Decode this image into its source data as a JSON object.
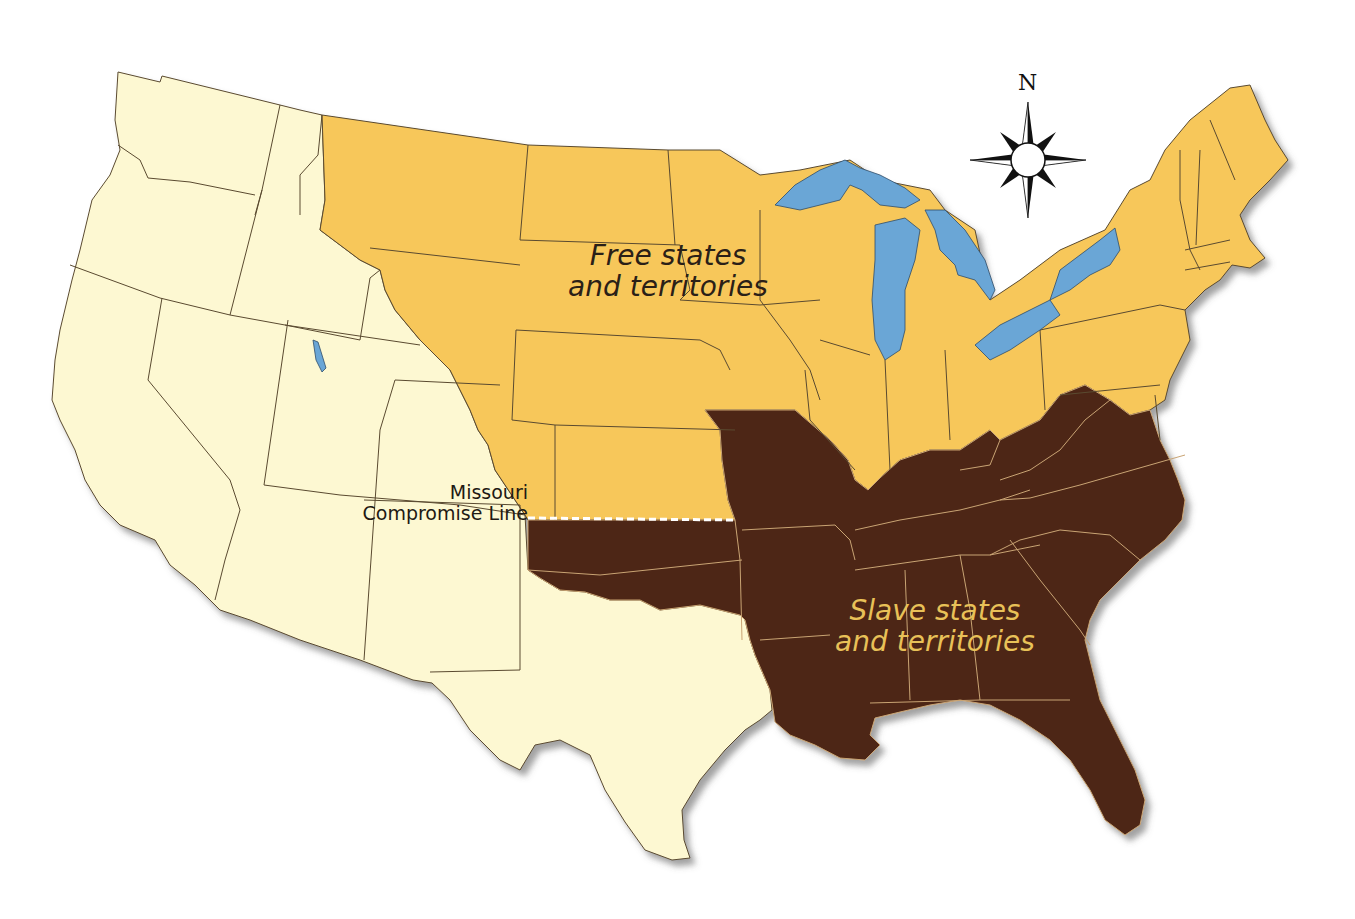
{
  "map": {
    "title": "",
    "regions": [
      {
        "id": "free",
        "label_line1": "Free states",
        "label_line2": "and territories",
        "color": "#f7c75a"
      },
      {
        "id": "slave",
        "label_line1": "Slave states",
        "label_line2": "and territories",
        "color": "#4d2512",
        "label_color": "#e8c158"
      },
      {
        "id": "unorganized-west",
        "label_line1": "",
        "label_line2": "",
        "color": "#fdf8d2"
      }
    ],
    "water_color": "#6aa6d6",
    "missouri_compromise_line": {
      "label_line1": "Missouri",
      "label_line2": "Compromise Line",
      "style": "dashed-white"
    },
    "compass": {
      "north_label": "N"
    }
  }
}
